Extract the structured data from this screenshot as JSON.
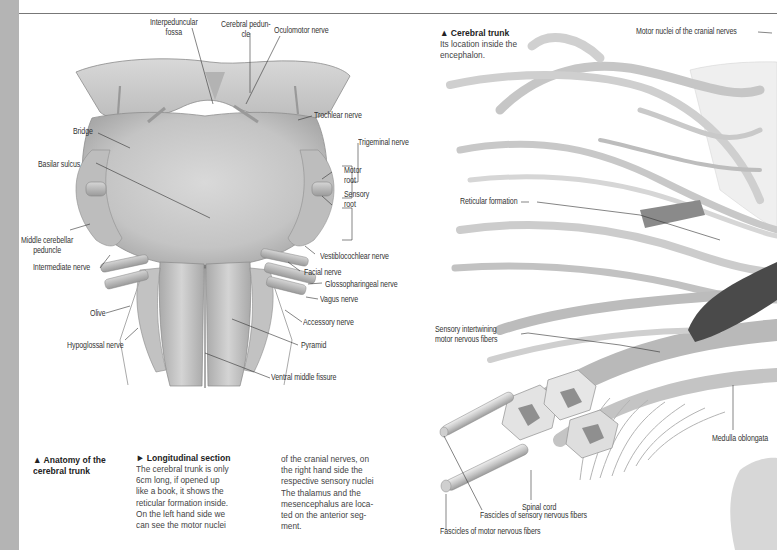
{
  "page": {
    "background": "#ffffff",
    "strip_color": "#b4b4b4",
    "rule_color": "#777777"
  },
  "left_figure": {
    "name": "Ventral view of the brainstem",
    "labels": {
      "interpeduncular_fossa": "Interpeduncular\nfossa",
      "cerebral_peduncle": "Cerebral pedun-\ncle",
      "oculomotor_nerve": "Oculomotor nerve",
      "trochlear_nerve": "Trochlear nerve",
      "bridge": "Bridge",
      "trigeminal_nerve": "Trigeminal nerve",
      "basilar_sulcus": "Basilar sulcus",
      "motor_root": "Motor\nroot",
      "sensory_root": "Sensory\nroot",
      "middle_cerebellar_peduncle": "Middle cerebellar\npeduncle",
      "intermediate_nerve": "Intermediate nerve",
      "vestibulocochlear_nerve": "Vestiblocochlear nerve",
      "facial_nerve": "Facial nerve",
      "glossopharyngeal_nerve": "Glossopharingeal nerve",
      "vagus_nerve": "Vagus nerve",
      "olive": "Olive",
      "accessory_nerve": "Accessory nerve",
      "pyramid": "Pyramid",
      "hypoglossal_nerve": "Hypoglossal nerve",
      "ventral_middle_fissure": "Ventral middle fissure"
    }
  },
  "captions": {
    "anatomy": {
      "icon": "triangle-up",
      "title": "▲ Anatomy of the\ncerebral trunk"
    },
    "longitudinal": {
      "icon": "triangle-right",
      "title": "► Longitudinal section",
      "col1": "The cerebral trunk is only\n6cm long, if opened up\nlike a book, it shows the\nreticular formation inside.\nOn the left hand side we\ncan see the motor nuclei",
      "col2": "of the cranial nerves, on\nthe right hand side the\nrespective sensory nuclei\nThe thalamus and the\nmesencephalus are loca-\nted on the anterior seg-\nment."
    },
    "cerebral_trunk": {
      "icon": "triangle-up",
      "title": "▲ Cerebral trunk",
      "text": "Its location inside the\nencephalon."
    }
  },
  "right_figure": {
    "name": "Longitudinal section of the cerebral trunk",
    "labels": {
      "motor_nuclei": "Motor nuclei of the cranial nerves",
      "reticular_formation": "Reticular formation",
      "sensory_intertwining": "Sensory intertwining\nmotor nervous fibers",
      "medulla_oblongata": "Medulla oblongata",
      "spinal_cord": "Spinal cord",
      "fascicles_sensory": "Fascicles of sensory nervous fibers",
      "fascicles_motor": "Fascicles of motor nervous fibers"
    }
  }
}
